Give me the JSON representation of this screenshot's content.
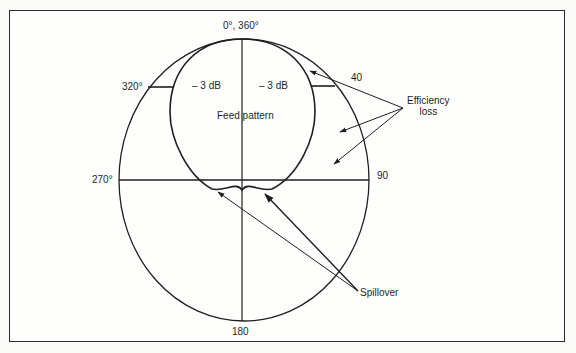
{
  "diagram": {
    "type": "polar antenna feed pattern",
    "angle_labels": {
      "top": "0°, 360°",
      "upper_left": "320°",
      "upper_right": "40",
      "left": "270°",
      "right": "90",
      "bottom": "180"
    },
    "inner_labels": {
      "left_3db": "– 3 dB",
      "right_3db": "– 3 dB",
      "center": "Feed pattern"
    },
    "callouts": {
      "efficiency_line1": "Efficiency",
      "efficiency_line2": "loss",
      "spillover": "Spillover"
    },
    "colors": {
      "line": "#1f1f1f",
      "background": "#fefefd"
    }
  }
}
